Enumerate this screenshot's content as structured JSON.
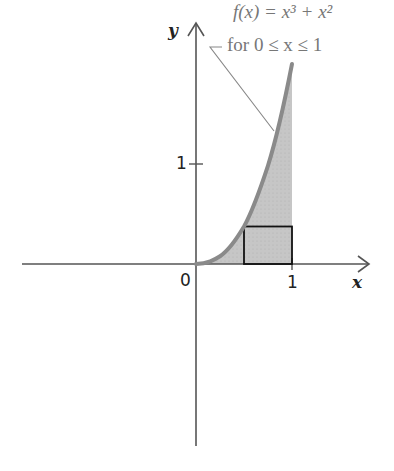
{
  "figure": {
    "function": {
      "line1": "f(x) = x³ + x²",
      "line2": "for 0 ≤ x ≤ 1",
      "expression": "x^3 + x^2",
      "domain": [
        0,
        1
      ]
    },
    "axes": {
      "x_label": "x",
      "y_label": "y",
      "origin_label": "0",
      "x_tick_label": "1",
      "y_tick_label": "1"
    },
    "rectangle": {
      "x_from": 0.5,
      "x_to": 1,
      "height": 0.375,
      "description": "approximating rectangle of height f(0.5)"
    },
    "colors": {
      "axis": "#555555",
      "curve": "#8a8a8a",
      "fill": "#c8c8c8",
      "rectangle": "#111111",
      "annotation": "#777777",
      "leader": "#888888"
    }
  }
}
